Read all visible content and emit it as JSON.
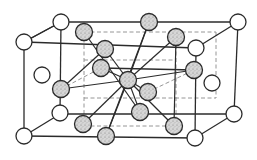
{
  "diagram": {
    "title": "",
    "colors": {
      "line": "#2b2b2b",
      "dashed": "#8a8a8a",
      "shade": "#c8c8c8",
      "background": "#ffffff"
    },
    "atom_radius": {
      "open": 8,
      "shaded": 8.5
    },
    "outer_cube_edges": [
      [
        24,
        42,
        196,
        48
      ],
      [
        196,
        48,
        238,
        22
      ],
      [
        238,
        22,
        61,
        22
      ],
      [
        61,
        22,
        24,
        42
      ],
      [
        24,
        136,
        195,
        138
      ],
      [
        195,
        138,
        234,
        114
      ],
      [
        234,
        114,
        60,
        114
      ],
      [
        60,
        114,
        24,
        136
      ],
      [
        24,
        42,
        24,
        136
      ],
      [
        196,
        48,
        195,
        138
      ],
      [
        238,
        22,
        234,
        114
      ],
      [
        61,
        22,
        60,
        114
      ],
      [
        24,
        42,
        61,
        22
      ],
      [
        101,
        68,
        194,
        70
      ]
    ],
    "inner_dashed_edges": [
      [
        84,
        32,
        216,
        32
      ],
      [
        84,
        32,
        84,
        126
      ],
      [
        176,
        32,
        176,
        126
      ],
      [
        84,
        126,
        176,
        126
      ],
      [
        84,
        98,
        216,
        98
      ],
      [
        216,
        32,
        216,
        98
      ],
      [
        61,
        89,
        101,
        68
      ],
      [
        148,
        92,
        194,
        70
      ],
      [
        84,
        60,
        176,
        60
      ]
    ],
    "bonds": [
      [
        128,
        80,
        149,
        22
      ],
      [
        128,
        80,
        105,
        49
      ],
      [
        128,
        80,
        101,
        68
      ],
      [
        128,
        80,
        148,
        92
      ],
      [
        128,
        80,
        140,
        112
      ],
      [
        128,
        80,
        106,
        136
      ],
      [
        128,
        80,
        83,
        124
      ],
      [
        128,
        80,
        176,
        37
      ],
      [
        128,
        80,
        194,
        70
      ],
      [
        128,
        80,
        61,
        89
      ],
      [
        128,
        80,
        174,
        126
      ],
      [
        84,
        32,
        140,
        112
      ],
      [
        149,
        22,
        106,
        136
      ],
      [
        105,
        49,
        61,
        89
      ],
      [
        176,
        37,
        174,
        126
      ]
    ],
    "open_atoms": [
      {
        "name": "corner-front-top-left",
        "x": 24,
        "y": 42
      },
      {
        "name": "corner-back-top-left",
        "x": 61,
        "y": 22
      },
      {
        "name": "corner-back-top-right",
        "x": 238,
        "y": 22
      },
      {
        "name": "corner-front-top-right",
        "x": 196,
        "y": 48
      },
      {
        "name": "corner-front-bottom-left",
        "x": 24,
        "y": 136
      },
      {
        "name": "corner-back-bottom-left",
        "x": 60,
        "y": 113
      },
      {
        "name": "corner-back-bottom-right",
        "x": 234,
        "y": 114
      },
      {
        "name": "corner-front-bottom-right",
        "x": 195,
        "y": 138
      },
      {
        "name": "face-left",
        "x": 42,
        "y": 75
      },
      {
        "name": "face-right",
        "x": 212,
        "y": 83
      }
    ],
    "shaded_atoms": [
      {
        "name": "center",
        "x": 128,
        "y": 80
      },
      {
        "name": "top-face",
        "x": 149,
        "y": 22
      },
      {
        "name": "upper-left-back",
        "x": 84,
        "y": 32
      },
      {
        "name": "upper-left",
        "x": 105,
        "y": 49
      },
      {
        "name": "left-mid",
        "x": 101,
        "y": 68
      },
      {
        "name": "upper-right",
        "x": 176,
        "y": 37
      },
      {
        "name": "right-face",
        "x": 194,
        "y": 70
      },
      {
        "name": "left-face",
        "x": 61,
        "y": 89
      },
      {
        "name": "lower-right-1",
        "x": 148,
        "y": 92
      },
      {
        "name": "lower-right-2",
        "x": 140,
        "y": 112
      },
      {
        "name": "bottom-front",
        "x": 106,
        "y": 136
      },
      {
        "name": "bottom-left",
        "x": 83,
        "y": 124
      },
      {
        "name": "bottom-right",
        "x": 174,
        "y": 126
      }
    ]
  }
}
